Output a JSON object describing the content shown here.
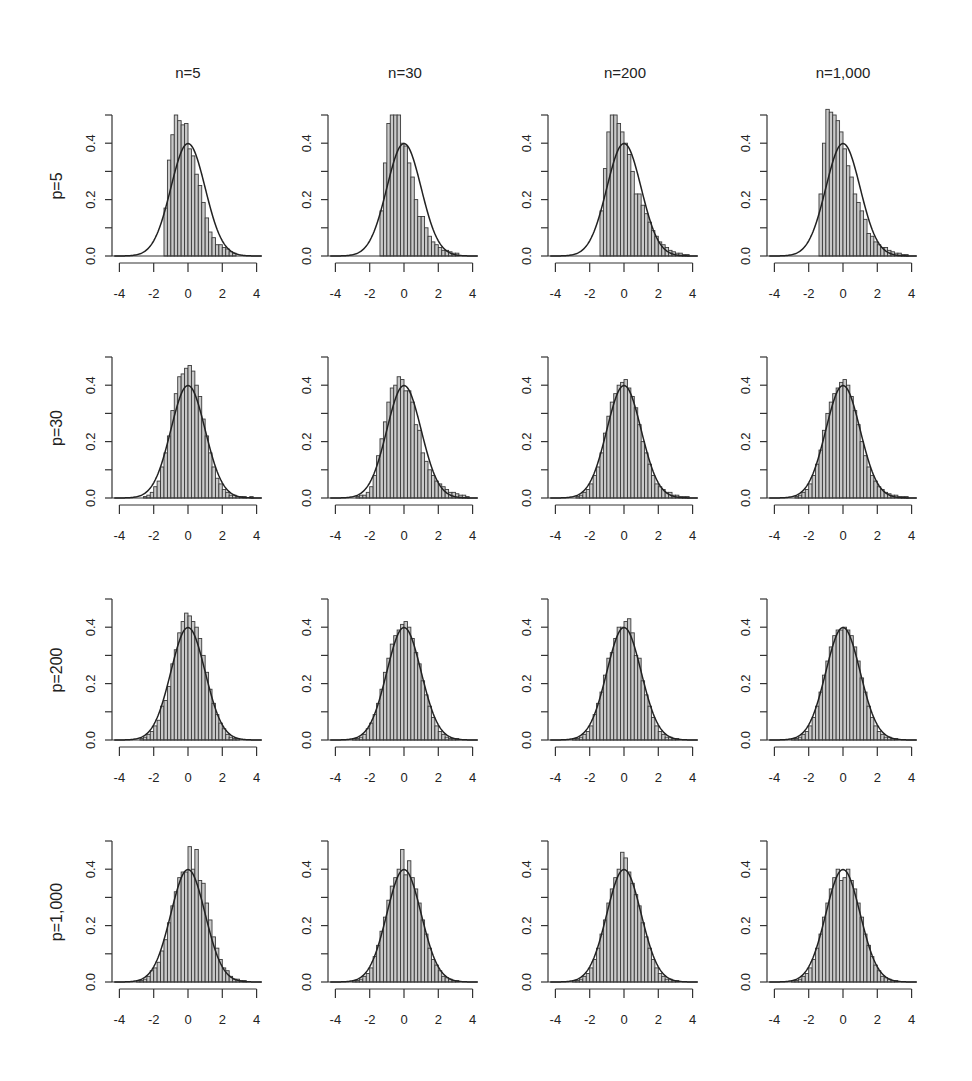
{
  "chart_data": {
    "type": "histogram-grid",
    "title": "",
    "columns": [
      "n=5",
      "n=30",
      "n=200",
      "n=1,000"
    ],
    "rows": [
      "p=5",
      "p=30",
      "p=200",
      "p=1,000"
    ],
    "xlim": [
      -4,
      4
    ],
    "ylim": [
      0,
      0.5
    ],
    "x_ticks": [
      -4,
      -2,
      0,
      2,
      4
    ],
    "x_tick_labels": [
      "-4",
      "-2",
      "0",
      "2",
      "4"
    ],
    "y_ticks": [
      0,
      0.1,
      0.2,
      0.3,
      0.4,
      0.5
    ],
    "y_tick_labels": [
      "0.0",
      "0.2",
      "0.4"
    ],
    "bin_width": 0.2,
    "overlay": "standard normal density N(0,1), peak 0.399",
    "grid": false,
    "panels": [
      [
        {
          "row": "p=5",
          "col": "n=5",
          "bin_start": -1.4,
          "densities": [
            0.17,
            0.34,
            0.43,
            0.5,
            0.48,
            0.465,
            0.47,
            0.38,
            0.355,
            0.29,
            0.25,
            0.19,
            0.135,
            0.085,
            0.065,
            0.04,
            0.04,
            0.03,
            0.025,
            0.015,
            0.01
          ]
        },
        {
          "row": "p=5",
          "col": "n=30",
          "bin_start": -1.4,
          "densities": [
            0.16,
            0.33,
            0.47,
            0.5,
            0.5,
            0.5,
            0.4,
            0.39,
            0.33,
            0.28,
            0.2,
            0.14,
            0.14,
            0.1,
            0.07,
            0.05,
            0.04,
            0.03,
            0.02,
            0.02,
            0.015,
            0.01,
            0.01
          ]
        },
        {
          "row": "p=5",
          "col": "n=200",
          "bin_start": -1.4,
          "densities": [
            0.16,
            0.31,
            0.44,
            0.5,
            0.5,
            0.47,
            0.44,
            0.4,
            0.36,
            0.3,
            0.22,
            0.22,
            0.18,
            0.15,
            0.12,
            0.09,
            0.07,
            0.05,
            0.04,
            0.03,
            0.02,
            0.015,
            0.01,
            0.01,
            0.005,
            0.005
          ]
        },
        {
          "row": "p=5",
          "col": "n=1,000",
          "bin_start": -1.4,
          "densities": [
            0.22,
            0.4,
            0.52,
            0.51,
            0.5,
            0.48,
            0.44,
            0.38,
            0.32,
            0.28,
            0.22,
            0.19,
            0.16,
            0.13,
            0.08,
            0.07,
            0.05,
            0.04,
            0.03,
            0.03,
            0.02,
            0.015,
            0.01,
            0.01,
            0.005,
            0.005
          ]
        }
      ],
      [
        {
          "row": "p=30",
          "col": "n=5",
          "bin_start": -3.0,
          "densities": [
            0.0,
            0.0,
            0.005,
            0.01,
            0.02,
            0.04,
            0.06,
            0.11,
            0.16,
            0.22,
            0.31,
            0.37,
            0.43,
            0.44,
            0.46,
            0.47,
            0.45,
            0.4,
            0.36,
            0.28,
            0.22,
            0.16,
            0.11,
            0.07,
            0.05,
            0.03,
            0.02,
            0.01,
            0.01,
            0.005,
            0.005,
            0.005,
            0.0,
            0.005
          ]
        },
        {
          "row": "p=30",
          "col": "n=30",
          "bin_start": -3.0,
          "densities": [
            0.0,
            0.005,
            0.01,
            0.01,
            0.02,
            0.04,
            0.08,
            0.15,
            0.21,
            0.27,
            0.34,
            0.39,
            0.4,
            0.43,
            0.42,
            0.38,
            0.38,
            0.34,
            0.26,
            0.24,
            0.16,
            0.13,
            0.1,
            0.08,
            0.06,
            0.05,
            0.04,
            0.03,
            0.02,
            0.02,
            0.015,
            0.01,
            0.01,
            0.005
          ]
        },
        {
          "row": "p=30",
          "col": "n=200",
          "bin_start": -3.0,
          "densities": [
            0.0,
            0.005,
            0.01,
            0.02,
            0.03,
            0.05,
            0.08,
            0.11,
            0.16,
            0.23,
            0.29,
            0.34,
            0.37,
            0.4,
            0.41,
            0.42,
            0.39,
            0.36,
            0.32,
            0.26,
            0.2,
            0.16,
            0.12,
            0.08,
            0.05,
            0.04,
            0.03,
            0.02,
            0.02,
            0.01,
            0.01,
            0.005,
            0.005,
            0.005
          ]
        },
        {
          "row": "p=30",
          "col": "n=1,000",
          "bin_start": -3.0,
          "densities": [
            0.0,
            0.005,
            0.01,
            0.02,
            0.03,
            0.05,
            0.08,
            0.12,
            0.17,
            0.24,
            0.3,
            0.34,
            0.37,
            0.39,
            0.41,
            0.42,
            0.4,
            0.36,
            0.31,
            0.26,
            0.2,
            0.15,
            0.11,
            0.08,
            0.06,
            0.04,
            0.03,
            0.02,
            0.015,
            0.01,
            0.01,
            0.005,
            0.005,
            0.005
          ]
        }
      ],
      [
        {
          "row": "p=200",
          "col": "n=5",
          "bin_start": -3.2,
          "densities": [
            0.0,
            0.0,
            0.005,
            0.01,
            0.02,
            0.03,
            0.05,
            0.07,
            0.12,
            0.14,
            0.19,
            0.27,
            0.32,
            0.38,
            0.42,
            0.45,
            0.44,
            0.42,
            0.4,
            0.36,
            0.3,
            0.24,
            0.18,
            0.13,
            0.09,
            0.06,
            0.04,
            0.02,
            0.01,
            0.005,
            0.005,
            0.0,
            0.0
          ]
        },
        {
          "row": "p=200",
          "col": "n=30",
          "bin_start": -3.2,
          "densities": [
            0.0,
            0.005,
            0.005,
            0.01,
            0.02,
            0.04,
            0.06,
            0.09,
            0.13,
            0.18,
            0.24,
            0.29,
            0.34,
            0.37,
            0.39,
            0.41,
            0.42,
            0.4,
            0.36,
            0.31,
            0.27,
            0.21,
            0.16,
            0.12,
            0.08,
            0.05,
            0.03,
            0.02,
            0.01,
            0.005,
            0.005,
            0.005,
            0.0
          ]
        },
        {
          "row": "p=200",
          "col": "n=200",
          "bin_start": -3.2,
          "densities": [
            0.0,
            0.005,
            0.005,
            0.01,
            0.02,
            0.03,
            0.05,
            0.09,
            0.13,
            0.17,
            0.23,
            0.29,
            0.31,
            0.36,
            0.4,
            0.4,
            0.42,
            0.43,
            0.38,
            0.3,
            0.29,
            0.21,
            0.16,
            0.12,
            0.08,
            0.05,
            0.03,
            0.02,
            0.01,
            0.01,
            0.005,
            0.005,
            0.0
          ]
        },
        {
          "row": "p=200",
          "col": "n=1,000",
          "bin_start": -3.2,
          "densities": [
            0.0,
            0.005,
            0.005,
            0.01,
            0.02,
            0.03,
            0.05,
            0.08,
            0.12,
            0.17,
            0.23,
            0.28,
            0.33,
            0.37,
            0.39,
            0.39,
            0.4,
            0.39,
            0.37,
            0.33,
            0.28,
            0.22,
            0.17,
            0.12,
            0.08,
            0.05,
            0.03,
            0.02,
            0.01,
            0.01,
            0.005,
            0.005,
            0.0
          ]
        }
      ],
      [
        {
          "row": "p=1,000",
          "col": "n=5",
          "bin_start": -3.2,
          "densities": [
            0.0,
            0.005,
            0.005,
            0.01,
            0.02,
            0.04,
            0.05,
            0.07,
            0.11,
            0.15,
            0.21,
            0.27,
            0.32,
            0.37,
            0.39,
            0.39,
            0.48,
            0.4,
            0.47,
            0.36,
            0.35,
            0.28,
            0.22,
            0.16,
            0.12,
            0.08,
            0.05,
            0.04,
            0.02,
            0.01,
            0.01,
            0.005,
            0.005
          ]
        },
        {
          "row": "p=1,000",
          "col": "n=30",
          "bin_start": -3.2,
          "densities": [
            0.0,
            0.005,
            0.005,
            0.01,
            0.02,
            0.03,
            0.05,
            0.09,
            0.13,
            0.18,
            0.23,
            0.29,
            0.34,
            0.37,
            0.4,
            0.47,
            0.38,
            0.43,
            0.37,
            0.33,
            0.28,
            0.22,
            0.17,
            0.12,
            0.08,
            0.06,
            0.04,
            0.02,
            0.015,
            0.01,
            0.005,
            0.005,
            0.0
          ]
        },
        {
          "row": "p=1,000",
          "col": "n=200",
          "bin_start": -3.2,
          "densities": [
            0.0,
            0.005,
            0.005,
            0.01,
            0.02,
            0.03,
            0.05,
            0.08,
            0.12,
            0.17,
            0.22,
            0.28,
            0.33,
            0.37,
            0.4,
            0.46,
            0.44,
            0.39,
            0.35,
            0.31,
            0.27,
            0.21,
            0.16,
            0.12,
            0.08,
            0.05,
            0.03,
            0.02,
            0.01,
            0.01,
            0.005,
            0.005,
            0.0
          ]
        },
        {
          "row": "p=1,000",
          "col": "n=1,000",
          "bin_start": -3.2,
          "densities": [
            0.0,
            0.005,
            0.005,
            0.01,
            0.02,
            0.03,
            0.05,
            0.08,
            0.12,
            0.17,
            0.23,
            0.28,
            0.33,
            0.37,
            0.4,
            0.36,
            0.37,
            0.4,
            0.36,
            0.33,
            0.28,
            0.23,
            0.17,
            0.13,
            0.09,
            0.06,
            0.04,
            0.02,
            0.015,
            0.01,
            0.005,
            0.005,
            0.0
          ]
        }
      ]
    ]
  },
  "figure": {
    "column_titles": [
      "n=5",
      "n=30",
      "n=200",
      "n=1,000"
    ],
    "row_titles": [
      "p=5",
      "p=30",
      "p=200",
      "p=1,000"
    ],
    "colors": {
      "bar_fill": "#c9c9c9",
      "bar_stroke": "#3a3a3a",
      "curve": "#222222",
      "axis": "#333333",
      "background": "#ffffff"
    }
  }
}
